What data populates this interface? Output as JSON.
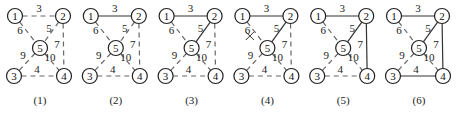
{
  "diagram": {
    "nodes": [
      {
        "id": "1",
        "x": 15,
        "y": 16
      },
      {
        "id": "2",
        "x": 63,
        "y": 16
      },
      {
        "id": "5",
        "x": 40,
        "y": 48
      },
      {
        "id": "3",
        "x": 14,
        "y": 76
      },
      {
        "id": "4",
        "x": 64,
        "y": 76
      }
    ],
    "edges": [
      {
        "from": "1",
        "to": "2",
        "weight": "3",
        "lx": 39,
        "ly": 12
      },
      {
        "from": "1",
        "to": "5",
        "weight": "6",
        "lx": 20,
        "ly": 34
      },
      {
        "from": "2",
        "to": "5",
        "weight": "5",
        "lx": 49,
        "ly": 32
      },
      {
        "from": "2",
        "to": "4",
        "weight": "7",
        "lx": 57,
        "ly": 48
      },
      {
        "from": "5",
        "to": "3",
        "weight": "9",
        "lx": 23,
        "ly": 59
      },
      {
        "from": "5",
        "to": "4",
        "weight": "10",
        "lx": 50,
        "ly": 61
      },
      {
        "from": "3",
        "to": "4",
        "weight": "4",
        "lx": 37,
        "ly": 73
      }
    ],
    "panels": [
      {
        "caption": "(1)",
        "offset": 0,
        "solid": [],
        "crossed": []
      },
      {
        "caption": "(2)",
        "offset": 75.8,
        "solid": [
          "1-2"
        ],
        "crossed": []
      },
      {
        "caption": "(3)",
        "offset": 151.6,
        "solid": [
          "1-2",
          "2-5"
        ],
        "crossed": []
      },
      {
        "caption": "(4)",
        "offset": 227.4,
        "solid": [
          "1-2",
          "2-5"
        ],
        "crossed": [
          "1-5"
        ]
      },
      {
        "caption": "(5)",
        "offset": 303.2,
        "solid": [
          "1-2",
          "2-5",
          "2-4"
        ],
        "crossed": []
      },
      {
        "caption": "(6)",
        "offset": 379,
        "solid": [
          "1-2",
          "2-5",
          "2-4",
          "3-4"
        ],
        "crossed": []
      }
    ]
  }
}
